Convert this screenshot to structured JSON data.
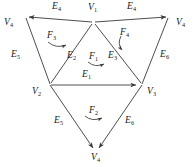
{
  "figure": {
    "kind": "triangular-net-diagram",
    "stroke_color": "#3a3a3a",
    "text_color": "#1a1a1a",
    "background_color": "#ffffff",
    "vertices": [
      {
        "id": "v4-left",
        "letter": "V",
        "sub": "4",
        "x": 12,
        "y": 18
      },
      {
        "id": "v1-top",
        "letter": "V",
        "sub": "1",
        "x": 93,
        "y": 13
      },
      {
        "id": "v4-right",
        "letter": "V",
        "sub": "4",
        "x": 180,
        "y": 18
      },
      {
        "id": "v2-mid",
        "letter": "V",
        "sub": "2",
        "x": 36,
        "y": 86
      },
      {
        "id": "v3-mid",
        "letter": "V",
        "sub": "3",
        "x": 153,
        "y": 86
      },
      {
        "id": "v4-bottom",
        "letter": "V",
        "sub": "4",
        "x": 96,
        "y": 157
      }
    ],
    "edges": [
      {
        "id": "e4-top-left",
        "letter": "E",
        "sub": "4",
        "x": 56,
        "y": 9
      },
      {
        "id": "e4-top-right",
        "letter": "E",
        "sub": "4",
        "x": 131,
        "y": 9
      },
      {
        "id": "e5-outer-left",
        "letter": "E",
        "sub": "5",
        "x": 16,
        "y": 56
      },
      {
        "id": "e6-outer-right",
        "letter": "E",
        "sub": "6",
        "x": 164,
        "y": 56
      },
      {
        "id": "e2-inner-left",
        "letter": "E",
        "sub": "2",
        "x": 72,
        "y": 56
      },
      {
        "id": "e3-inner-right",
        "letter": "E",
        "sub": "3",
        "x": 112,
        "y": 56
      },
      {
        "id": "e1-middle",
        "letter": "E",
        "sub": "1",
        "x": 86,
        "y": 77
      },
      {
        "id": "e5-lower-left",
        "letter": "E",
        "sub": "5",
        "x": 58,
        "y": 122
      },
      {
        "id": "e6-lower-right",
        "letter": "E",
        "sub": "6",
        "x": 129,
        "y": 122
      }
    ],
    "faces": [
      {
        "id": "f3-upper-left",
        "letter": "F",
        "sub": "3",
        "x": 52,
        "y": 33
      },
      {
        "id": "f4-upper-right",
        "letter": "F",
        "sub": "4",
        "x": 124,
        "y": 32
      },
      {
        "id": "f1-center",
        "letter": "F",
        "sub": "1",
        "x": 93,
        "y": 58
      },
      {
        "id": "f2-bottom",
        "letter": "F",
        "sub": "2",
        "x": 93,
        "y": 112
      }
    ]
  }
}
